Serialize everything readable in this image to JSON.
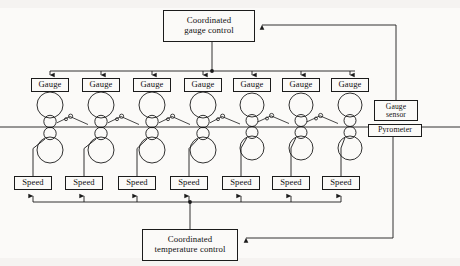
{
  "figure": {
    "stand_count": 7,
    "colors": {
      "line": "#1b1b1b",
      "background": "#fbfaf8",
      "text": "#111111"
    }
  },
  "controllers": {
    "gauge_control": {
      "line1": "Coordinated",
      "line2": "gauge control"
    },
    "temperature_control": {
      "line1": "Coordinated",
      "line2": "temperature control"
    }
  },
  "sensors": {
    "gauge_sensor": {
      "line1": "Gauge",
      "line2": "sensor"
    },
    "pyrometer": {
      "label": "Pyrometer"
    }
  },
  "gauge_boxes": [
    {
      "label": "Gauge"
    },
    {
      "label": "Gauge"
    },
    {
      "label": "Gauge"
    },
    {
      "label": "Gauge"
    },
    {
      "label": "Gauge"
    },
    {
      "label": "Gauge"
    },
    {
      "label": "Gauge"
    }
  ],
  "speed_boxes": [
    {
      "label": "Speed"
    },
    {
      "label": "Speed"
    },
    {
      "label": "Speed"
    },
    {
      "label": "Speed"
    },
    {
      "label": "Speed"
    },
    {
      "label": "Speed"
    },
    {
      "label": "Speed"
    }
  ],
  "geometry": {
    "stand_x": [
      50,
      101,
      152,
      203,
      252,
      301,
      350
    ],
    "gauge_box": {
      "y": 78,
      "w": 38,
      "h": 14
    },
    "speed_box": {
      "y": 176,
      "w": 38,
      "h": 14,
      "x": [
        14,
        65,
        118,
        170,
        222,
        272,
        322
      ]
    },
    "gauge_bus_y": 71,
    "speed_bus_y": 202,
    "strip_line_y": 127,
    "gauge_control_box": {
      "x": 163,
      "y": 10,
      "w": 92,
      "h": 32
    },
    "temperature_control_box": {
      "x": 142,
      "y": 229,
      "w": 96,
      "h": 32
    },
    "gauge_sensor_box": {
      "x": 374,
      "y": 100,
      "w": 44,
      "h": 21
    },
    "pyrometer_box": {
      "x": 368,
      "y": 124,
      "w": 54,
      "h": 13
    },
    "gauge_feedback_x": 396,
    "temp_feedback_x": 393
  }
}
